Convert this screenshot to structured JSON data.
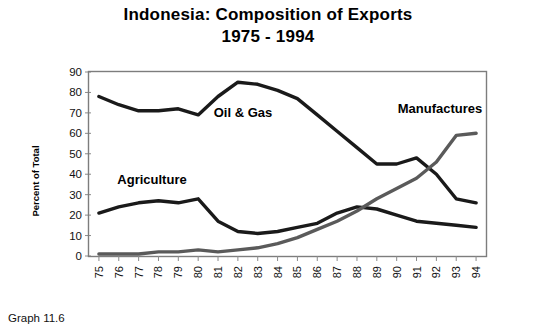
{
  "header": {
    "title": "Indonesia: Composition of Exports",
    "subtitle": "1975 - 1994"
  },
  "caption": "Graph 11.6",
  "axes": {
    "ylabel": "Percent of Total",
    "yticks": [
      "0",
      "10",
      "20",
      "30",
      "40",
      "50",
      "60",
      "70",
      "80",
      "90"
    ],
    "ylim": [
      0,
      90
    ]
  },
  "annotations": [
    {
      "name": "oil-and-gas-label",
      "text": "Oil & Gas",
      "x": 243,
      "y": 117
    },
    {
      "name": "manufactures-label",
      "text": "Manufactures",
      "x": 440,
      "y": 113
    },
    {
      "name": "agriculture-label",
      "text": "Agriculture",
      "x": 152,
      "y": 184
    }
  ],
  "chart_data": {
    "type": "line",
    "title": "Indonesia: Composition of Exports",
    "subtitle": "1975 - 1994",
    "xlabel": "",
    "ylabel": "Percent of Total",
    "ylim": [
      0,
      90
    ],
    "grid": false,
    "legend": "inline-annotations",
    "categories": [
      "75",
      "76",
      "77",
      "78",
      "79",
      "80",
      "81",
      "82",
      "83",
      "84",
      "85",
      "86",
      "87",
      "88",
      "89",
      "90",
      "91",
      "92",
      "93",
      "94"
    ],
    "series": [
      {
        "name": "Oil & Gas",
        "color": "#1a1a1a",
        "values": [
          78,
          74,
          71,
          71,
          72,
          69,
          78,
          85,
          84,
          81,
          77,
          69,
          61,
          53,
          45,
          45,
          48,
          40,
          28,
          26
        ]
      },
      {
        "name": "Agriculture",
        "color": "#1a1a1a",
        "values": [
          21,
          24,
          26,
          27,
          26,
          28,
          17,
          12,
          11,
          12,
          14,
          16,
          21,
          24,
          23,
          20,
          17,
          16,
          15,
          14
        ]
      },
      {
        "name": "Manufactures",
        "color": "#5a5a5a",
        "values": [
          1,
          1,
          1,
          2,
          2,
          3,
          2,
          3,
          4,
          6,
          9,
          13,
          17,
          22,
          28,
          33,
          38,
          46,
          59,
          60
        ]
      }
    ]
  }
}
